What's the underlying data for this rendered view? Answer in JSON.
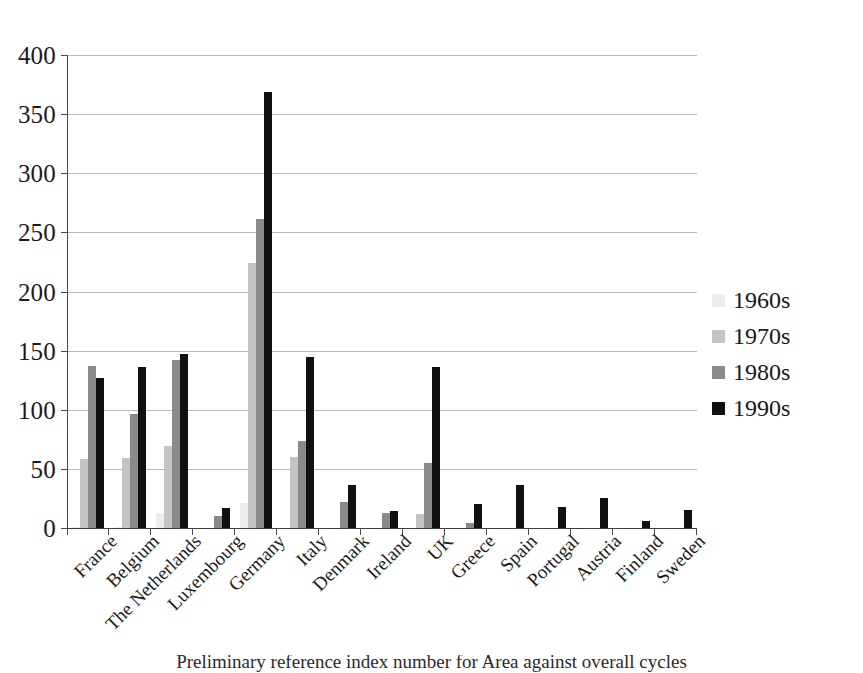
{
  "chart_data": {
    "type": "bar",
    "title": "",
    "xlabel": "",
    "ylabel": "",
    "ylim": [
      0,
      400
    ],
    "yticks": [
      0,
      50,
      100,
      150,
      200,
      250,
      300,
      350,
      400
    ],
    "grid": true,
    "legend_position": "right",
    "categories": [
      "France",
      "Belgium",
      "The Netherlands",
      "Luxembourg",
      "Germany",
      "Italy",
      "Denmark",
      "Ireland",
      "UK",
      "Greece",
      "Spain",
      "Portugal",
      "Austria",
      "Finland",
      "Sweden"
    ],
    "series": [
      {
        "name": "1960s",
        "color": "#ececec",
        "values": [
          1,
          1,
          13,
          0,
          21,
          0,
          0,
          0,
          0,
          0,
          0,
          0,
          0,
          0,
          0
        ]
      },
      {
        "name": "1970s",
        "color": "#c4c4c4",
        "values": [
          58,
          59,
          69,
          0,
          224,
          60,
          0,
          0,
          12,
          0,
          0,
          0,
          0,
          0,
          0
        ]
      },
      {
        "name": "1980s",
        "color": "#8a8a8a",
        "values": [
          137,
          96,
          142,
          10,
          261,
          74,
          22,
          13,
          55,
          4,
          0,
          0,
          0,
          0,
          0
        ]
      },
      {
        "name": "1990s",
        "color": "#111111",
        "values": [
          127,
          136,
          147,
          17,
          369,
          145,
          36,
          14,
          136,
          20,
          36,
          18,
          25,
          6,
          15
        ]
      }
    ]
  },
  "legend": {
    "items": [
      {
        "label": "1960s",
        "swatch_class": "s1960"
      },
      {
        "label": "1970s",
        "swatch_class": "s1970"
      },
      {
        "label": "1980s",
        "swatch_class": "s1980"
      },
      {
        "label": "1990s",
        "swatch_class": "s1990"
      }
    ]
  },
  "caption": {
    "text": "Preliminary reference index number for Area against overall cycles"
  }
}
